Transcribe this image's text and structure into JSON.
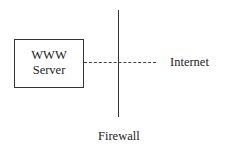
{
  "diagram": {
    "server": {
      "line1": "WWW",
      "line2": "Server"
    },
    "internet_label": "Internet",
    "firewall_label": "Firewall"
  }
}
